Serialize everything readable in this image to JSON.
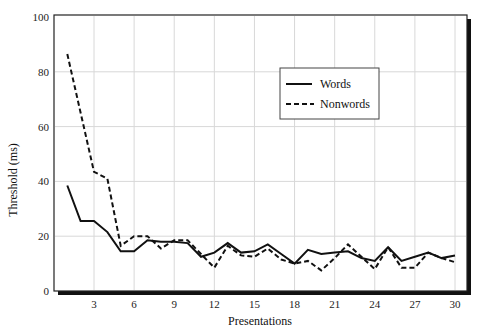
{
  "chart_data": {
    "type": "line",
    "title": "",
    "xlabel": "Presentations",
    "ylabel": "Threshold (ms)",
    "xlim": [
      0,
      30
    ],
    "ylim": [
      0,
      100
    ],
    "xticks": [
      3,
      6,
      9,
      12,
      15,
      18,
      21,
      24,
      27,
      30
    ],
    "yticks": [
      0,
      20,
      40,
      60,
      80,
      100
    ],
    "grid": true,
    "legend_position": "upper-right-center",
    "series": [
      {
        "name": "Words",
        "style": "solid",
        "x": [
          1,
          2,
          3,
          4,
          5,
          6,
          7,
          8,
          9,
          10,
          11,
          12,
          13,
          14,
          15,
          16,
          17,
          18,
          19,
          20,
          21,
          22,
          23,
          24,
          25,
          26,
          27,
          28,
          29,
          30
        ],
        "values": [
          38.5,
          25.5,
          25.5,
          21.5,
          14.5,
          14.5,
          18.5,
          18,
          18,
          17.5,
          12.5,
          14,
          17.5,
          14,
          14.5,
          17,
          13.5,
          10,
          15,
          13.5,
          14,
          14.5,
          12,
          11,
          16,
          11,
          12.5,
          14,
          12,
          13
        ]
      },
      {
        "name": "Nonwords",
        "style": "dashed",
        "x": [
          1,
          3,
          4,
          5,
          6,
          7,
          8,
          9,
          10,
          11,
          12,
          13,
          14,
          15,
          16,
          17,
          18,
          19,
          20,
          21,
          22,
          23,
          24,
          25,
          26,
          27,
          28,
          29,
          30
        ],
        "values": [
          86.5,
          43.5,
          41,
          16.5,
          20,
          20,
          15.5,
          18.5,
          18.5,
          13.5,
          8.5,
          16.5,
          13,
          12.5,
          15.5,
          11.5,
          10,
          11,
          7.5,
          12,
          17,
          12.5,
          8,
          16,
          8.5,
          8.5,
          14,
          12,
          10.5
        ]
      }
    ]
  },
  "legend": {
    "words_label": "Words",
    "nonwords_label": "Nonwords"
  },
  "axes": {
    "xlabel": "Presentations",
    "ylabel": "Threshold (ms)"
  }
}
